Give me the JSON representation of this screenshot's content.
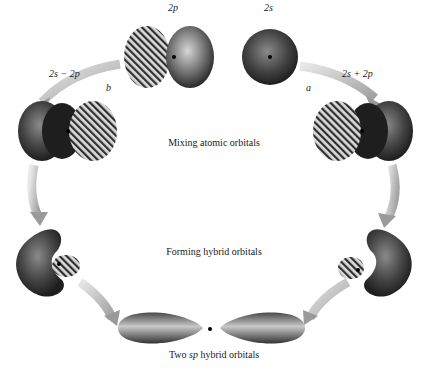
{
  "labels": {
    "p_orbital": "2p",
    "s_orbital": "2s",
    "minus_combo": "2s − 2p",
    "plus_combo": "2s + 2p",
    "path_b": "b",
    "path_a": "a"
  },
  "captions": {
    "mixing": "Mixing atomic orbitals",
    "forming": "Forming hybrid orbitals",
    "result_prefix": "Two ",
    "result_italic": "sp",
    "result_suffix": " hybrid orbitals"
  },
  "colors": {
    "orbital_dark": "#2a2a2a",
    "orbital_light": "#bdbdbd",
    "arrow": "#b8b8b8",
    "background": "#ffffff"
  }
}
